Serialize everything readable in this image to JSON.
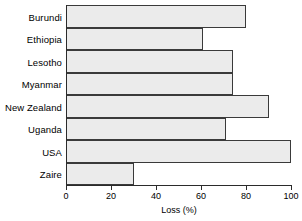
{
  "chart_data": {
    "type": "bar",
    "orientation": "horizontal",
    "title": "",
    "xlabel": "Loss (%)",
    "ylabel": "",
    "categories": [
      "Burundi",
      "Ethiopia",
      "Lesotho",
      "Myanmar",
      "New Zealand",
      "Uganda",
      "USA",
      "Zaire"
    ],
    "values": [
      80,
      61,
      74,
      74,
      90,
      71,
      100,
      30
    ],
    "xlim": [
      0,
      100
    ],
    "xticks": [
      0,
      20,
      40,
      60,
      80,
      100
    ],
    "xtick_labels": [
      "0",
      "20",
      "40",
      "60",
      "80",
      "100"
    ],
    "grid": false,
    "legend": null,
    "bar_fill_color": "#ebebeb",
    "bar_border_color": "#3a3a3a",
    "axis_color": "#2b2b2b",
    "background_color": "#ffffff"
  }
}
